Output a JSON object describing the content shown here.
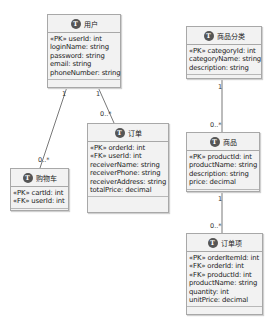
{
  "entities": {
    "user": {
      "title": "用户",
      "icon": "T",
      "fields": [
        "«PK» userId: int",
        "loginName: string",
        "password: string",
        "email: string",
        "phoneNumber: string"
      ]
    },
    "cart": {
      "title": "购物车",
      "icon": "T",
      "fields": [
        "«PK» cartId: int",
        "«FK» userId: int"
      ]
    },
    "order": {
      "title": "订单",
      "icon": "T",
      "fields": [
        "«PK» orderId: int",
        "«FK» userId: int",
        "receiverName: string",
        "receiverPhone: string",
        "receiverAddress: string",
        "totalPrice: decimal"
      ]
    },
    "category": {
      "title": "商品分类",
      "icon": "T",
      "fields": [
        "«PK» categoryId: int",
        "categoryName: string",
        "description: string"
      ]
    },
    "product": {
      "title": "商品",
      "icon": "T",
      "fields": [
        "«PK» productId: int",
        "productName: string",
        "description: string",
        "price: decimal"
      ]
    },
    "orderItem": {
      "title": "订单项",
      "icon": "T",
      "fields": [
        "«PK» orderItemId: int",
        "«FK» orderId: int",
        "«FK» productId: int",
        "productName: string",
        "quantity: int",
        "unitPrice: decimal"
      ]
    }
  },
  "relations": {
    "user_cart": {
      "from": "1",
      "to": "0..*"
    },
    "user_order": {
      "from": "1",
      "to": "0..*"
    },
    "category_product": {
      "from": "1",
      "to": "0..*"
    },
    "product_orderItem": {
      "from": "1",
      "to": "0..*"
    }
  },
  "colors": {
    "box_bg": "#f2f2f2",
    "border": "#a8a8a8",
    "icon": "#555555",
    "line": "#555555"
  }
}
